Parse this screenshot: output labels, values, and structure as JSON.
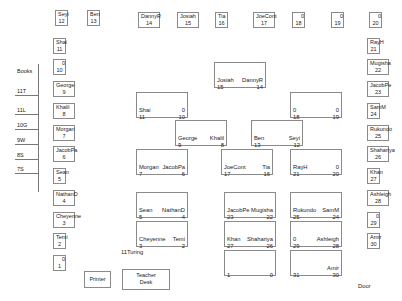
{
  "title": "11Turing",
  "door_label": "Door",
  "printer_label": "Printer",
  "teacher_desk": {
    "line1": "Teacher",
    "line2": "Desk"
  },
  "bookshelf": {
    "title": "Books",
    "shelves": [
      "11T",
      "11L",
      "10G",
      "9W",
      "8S",
      "7S"
    ]
  },
  "wall_seats": [
    {
      "name": "Seyi",
      "num": "12",
      "x": 55,
      "y": 10
    },
    {
      "name": "Ben",
      "num": "13",
      "x": 87,
      "y": 10
    },
    {
      "name": "DannyR",
      "num": "14",
      "x": 138,
      "y": 12
    },
    {
      "name": "Josiah",
      "num": "15",
      "x": 177,
      "y": 12
    },
    {
      "name": "Tia",
      "num": "16",
      "x": 215,
      "y": 12
    },
    {
      "name": "JoeCont",
      "num": "17",
      "x": 253,
      "y": 12
    },
    {
      "name": "0",
      "num": "18",
      "x": 292,
      "y": 12
    },
    {
      "name": "0",
      "num": "19",
      "x": 331,
      "y": 12
    },
    {
      "name": "0",
      "num": "20",
      "x": 369,
      "y": 12
    },
    {
      "name": "Shai",
      "num": "11",
      "x": 53,
      "y": 38
    },
    {
      "name": "0",
      "num": "10",
      "x": 53,
      "y": 59
    },
    {
      "name": "George",
      "num": "9",
      "x": 53,
      "y": 81
    },
    {
      "name": "Khalil",
      "num": "8",
      "x": 53,
      "y": 103
    },
    {
      "name": "Morgan",
      "num": "7",
      "x": 53,
      "y": 125
    },
    {
      "name": "JacobPa",
      "num": "6",
      "x": 53,
      "y": 146
    },
    {
      "name": "Sean",
      "num": "5",
      "x": 53,
      "y": 168
    },
    {
      "name": "NathanD",
      "num": "4",
      "x": 53,
      "y": 190
    },
    {
      "name": "Cheyenne",
      "num": "3",
      "x": 53,
      "y": 212
    },
    {
      "name": "Temi",
      "num": "2",
      "x": 53,
      "y": 233
    },
    {
      "name": "0",
      "num": "1",
      "x": 53,
      "y": 255
    },
    {
      "name": "RayH",
      "num": "21",
      "x": 367,
      "y": 38
    },
    {
      "name": "Mugisha",
      "num": "22",
      "x": 367,
      "y": 59
    },
    {
      "name": "JacobPe",
      "num": "23",
      "x": 367,
      "y": 81
    },
    {
      "name": "SamM",
      "num": "24",
      "x": 367,
      "y": 103
    },
    {
      "name": "Rukundo",
      "num": "25",
      "x": 367,
      "y": 125
    },
    {
      "name": "Shahariya",
      "num": "26",
      "x": 367,
      "y": 146
    },
    {
      "name": "Khan",
      "num": "27",
      "x": 367,
      "y": 168
    },
    {
      "name": "Ashleigh",
      "num": "28",
      "x": 367,
      "y": 190
    },
    {
      "name": "0",
      "num": "29",
      "x": 367,
      "y": 212
    },
    {
      "name": "Amir",
      "num": "30",
      "x": 367,
      "y": 233
    }
  ],
  "desks": [
    {
      "left_name": "Josiah",
      "left_num": "15",
      "right_name": "DannyR",
      "right_num": "14",
      "x": 214,
      "y": 62,
      "w": 52,
      "h": 26
    },
    {
      "left_name": "Shai",
      "left_num": "11",
      "right_name": "0",
      "right_num": "10",
      "x": 136,
      "y": 92,
      "w": 52,
      "h": 26
    },
    {
      "left_name": "0",
      "left_num": "18",
      "right_name": "0",
      "right_num": "19",
      "x": 290,
      "y": 92,
      "w": 52,
      "h": 26
    },
    {
      "left_name": "George",
      "left_num": "9",
      "right_name": "Khalil",
      "right_num": "8",
      "x": 175,
      "y": 120,
      "w": 52,
      "h": 26
    },
    {
      "left_name": "Ben",
      "left_num": "13",
      "right_name": "Seyi",
      "right_num": "12",
      "x": 251,
      "y": 120,
      "w": 52,
      "h": 26
    },
    {
      "left_name": "Morgan",
      "left_num": "7",
      "right_name": "JacobPa",
      "right_num": "6",
      "x": 136,
      "y": 149,
      "w": 52,
      "h": 26
    },
    {
      "left_name": "JoeCont",
      "left_num": "17",
      "right_name": "Tia",
      "right_num": "16",
      "x": 221,
      "y": 149,
      "w": 52,
      "h": 26
    },
    {
      "left_name": "RayH",
      "left_num": "21",
      "right_name": "0",
      "right_num": "20",
      "x": 290,
      "y": 149,
      "w": 52,
      "h": 26
    },
    {
      "left_name": "Sean",
      "left_num": "5",
      "right_name": "NathanD",
      "right_num": "4",
      "x": 136,
      "y": 192,
      "w": 52,
      "h": 26
    },
    {
      "left_name": "JacobPe",
      "left_num": "23",
      "right_name": "Mugisha",
      "right_num": "22",
      "x": 224,
      "y": 192,
      "w": 52,
      "h": 26
    },
    {
      "left_name": "Rukundo",
      "left_num": "25",
      "right_name": "SamM",
      "right_num": "24",
      "x": 290,
      "y": 192,
      "w": 52,
      "h": 26
    },
    {
      "left_name": "Cheyenne",
      "left_num": "3",
      "right_name": "Temi",
      "right_num": "2",
      "x": 136,
      "y": 221,
      "w": 52,
      "h": 26
    },
    {
      "left_name": "Khan",
      "left_num": "27",
      "right_name": "Shahariya",
      "right_num": "26",
      "x": 224,
      "y": 221,
      "w": 52,
      "h": 26
    },
    {
      "left_name": "0",
      "left_num": "29",
      "right_name": "Ashleigh",
      "right_num": "28",
      "x": 290,
      "y": 221,
      "w": 52,
      "h": 26
    },
    {
      "left_name": "",
      "left_num": "1",
      "right_name": "",
      "right_num": "0",
      "x": 224,
      "y": 250,
      "w": 52,
      "h": 26
    },
    {
      "left_name": "",
      "left_num": "31",
      "right_name": "Amir",
      "right_num": "30",
      "x": 290,
      "y": 250,
      "w": 52,
      "h": 26
    }
  ]
}
